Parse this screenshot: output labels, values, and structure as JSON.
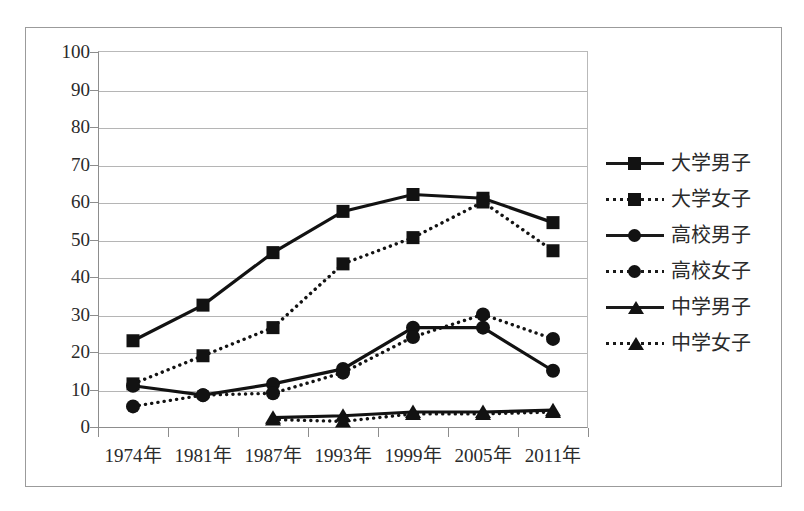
{
  "chart_data": {
    "type": "line",
    "title": "",
    "subtitle": "",
    "xlabel": "",
    "ylabel": "",
    "categories": [
      "1974年",
      "1981年",
      "1987年",
      "1993年",
      "1999年",
      "2005年",
      "2011年"
    ],
    "ylim": [
      0,
      100
    ],
    "ytick_labels": [
      "100",
      "90",
      "80",
      "70",
      "60",
      "50",
      "40",
      "30",
      "20",
      "10",
      "0"
    ],
    "ytick_values": [
      100,
      90,
      80,
      70,
      60,
      50,
      40,
      30,
      20,
      10,
      0
    ],
    "grid": true,
    "legend_position": "right",
    "series": [
      {
        "name": "大学男子",
        "style": "solid",
        "marker": "square",
        "color": "#121212",
        "values": [
          23,
          32.5,
          46.5,
          57.5,
          62,
          61,
          54.5
        ]
      },
      {
        "name": "大学女子",
        "style": "dotted",
        "marker": "square",
        "color": "#121212",
        "values": [
          11.5,
          19,
          26.5,
          43.5,
          50.5,
          60,
          47
        ]
      },
      {
        "name": "高校男子",
        "style": "solid",
        "marker": "circle",
        "color": "#121212",
        "values": [
          11,
          8.5,
          11.5,
          15.5,
          26.5,
          26.5,
          15
        ]
      },
      {
        "name": "高校女子",
        "style": "dotted",
        "marker": "circle",
        "color": "#121212",
        "values": [
          5.5,
          8.5,
          9,
          14.5,
          24,
          30,
          23.5
        ]
      },
      {
        "name": "中学男子",
        "style": "solid",
        "marker": "triangle",
        "color": "#121212",
        "values": [
          null,
          null,
          2.5,
          3,
          4,
          4,
          4.5
        ]
      },
      {
        "name": "中学女子",
        "style": "dotted",
        "marker": "triangle",
        "color": "#121212",
        "values": [
          null,
          null,
          2,
          1.5,
          3.5,
          3.5,
          4
        ]
      }
    ]
  },
  "legend": {
    "items": [
      {
        "label": "大学男子",
        "style": "solid",
        "marker": "square"
      },
      {
        "label": "大学女子",
        "style": "dotted",
        "marker": "square"
      },
      {
        "label": "高校男子",
        "style": "solid",
        "marker": "circle"
      },
      {
        "label": "高校女子",
        "style": "dotted",
        "marker": "circle"
      },
      {
        "label": "中学男子",
        "style": "solid",
        "marker": "triangle"
      },
      {
        "label": "中学女子",
        "style": "dotted",
        "marker": "triangle"
      }
    ]
  },
  "colors": {
    "series": "#121212",
    "grid": "#b5b5b5",
    "axis": "#8d8d8d",
    "frame": "#9b9b9b",
    "text": "#2a2a2a",
    "background": "#ffffff"
  }
}
